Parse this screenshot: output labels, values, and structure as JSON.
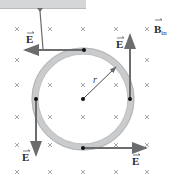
{
  "figure": {
    "callout": {
      "text": ""
    },
    "field_label": "B",
    "field_subscript": "in",
    "radius_label": "r",
    "e_labels": [
      "E",
      "E",
      "E",
      "E"
    ],
    "colors": {
      "arrow": "#6a6c6e",
      "ring": "#c9cbcd",
      "cross": "#9a9c9e",
      "callout": "#d4d6d8"
    }
  }
}
